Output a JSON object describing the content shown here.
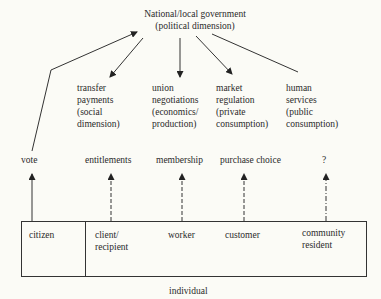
{
  "title": {
    "line1": "National/local government",
    "line2": "(political dimension)"
  },
  "dimensions": [
    {
      "id": "transfer",
      "text": "transfer\npayments\n(social\ndimension)"
    },
    {
      "id": "union",
      "text": "union\nnegotiations\n(economics/\nproduction)"
    },
    {
      "id": "market",
      "text": "market\nregulation\n(private\nconsumption)"
    },
    {
      "id": "human",
      "text": "human\nservices\n(public\nconsumption)"
    }
  ],
  "mechanisms": [
    {
      "id": "vote",
      "label": "vote",
      "line": "solid"
    },
    {
      "id": "entitlements",
      "label": "entitlements",
      "line": "dashed"
    },
    {
      "id": "membership",
      "label": "membership",
      "line": "dashed"
    },
    {
      "id": "purchase",
      "label": "purchase choice",
      "line": "dashed"
    },
    {
      "id": "unknown",
      "label": "?",
      "line": "dash-dot"
    }
  ],
  "roles": [
    {
      "id": "citizen",
      "text": "citizen"
    },
    {
      "id": "client",
      "text": "client/\nrecipient"
    },
    {
      "id": "worker",
      "text": "worker"
    },
    {
      "id": "customer",
      "text": "customer"
    },
    {
      "id": "community",
      "text": "community\nresident"
    }
  ],
  "box_caption": "individual",
  "colors": {
    "background": "#fbfbf6",
    "ink": "#2a2a2a"
  }
}
